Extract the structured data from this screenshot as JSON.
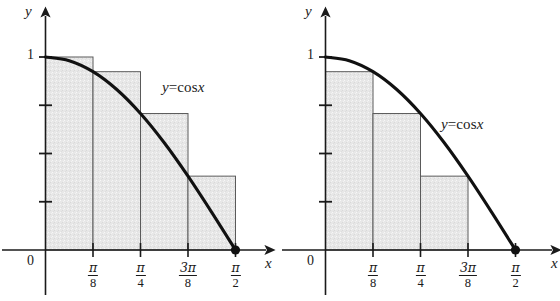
{
  "figure": {
    "background_color": "#ffffff",
    "ink_color": "#1a1a1a",
    "rect_fill_color": "#e5e5e5",
    "rect_border_color": "#555555",
    "curve_color": "#111111"
  },
  "panels": [
    {
      "id": "left",
      "axis_y_label": "y",
      "axis_x_label": "x",
      "origin_label": "0",
      "y_tick_label": "1",
      "curve_label": {
        "lhs": "y",
        "op": "=",
        "fn": "cos",
        "arg": "x",
        "full": "y = cos x"
      },
      "x_tick_labels": [
        {
          "num": "π",
          "den": "8"
        },
        {
          "num": "π",
          "den": "4"
        },
        {
          "num": "3π",
          "den": "8"
        },
        {
          "num": "π",
          "den": "2"
        }
      ]
    },
    {
      "id": "right",
      "axis_y_label": "y",
      "axis_x_label": "x",
      "origin_label": "0",
      "y_tick_label": "1",
      "curve_label": {
        "lhs": "y",
        "op": "=",
        "fn": "cos",
        "arg": "x",
        "full": "y = cos x"
      },
      "x_tick_labels": [
        {
          "num": "π",
          "den": "8"
        },
        {
          "num": "π",
          "den": "4"
        },
        {
          "num": "3π",
          "den": "8"
        },
        {
          "num": "π",
          "den": "2"
        }
      ]
    }
  ],
  "chart_data": [
    {
      "type": "bar",
      "id": "left-riemann-upper-sum",
      "title": "",
      "xlabel": "x",
      "ylabel": "y",
      "xlim": [
        0,
        1.5707963
      ],
      "ylim": [
        0,
        1.08
      ],
      "grid": false,
      "legend": null,
      "annotations": [
        "y = cos x"
      ],
      "x_tick_values": [
        0.3926991,
        0.7853982,
        1.1780972,
        1.5707963
      ],
      "x_tick_labels": [
        "π/8",
        "π/4",
        "3π/8",
        "π/2"
      ],
      "y_tick_values": [
        0.25,
        0.5,
        0.75,
        1.0
      ],
      "y_tick_labels": [
        "",
        "",
        "",
        "1"
      ],
      "bar_edges": [
        0.0,
        0.3926991,
        0.7853982,
        1.1780972,
        1.5707963
      ],
      "categories": [
        "[0, π/8]",
        "[π/8, π/4]",
        "[π/4, 3π/8]",
        "[3π/8, π/2]"
      ],
      "values": [
        1.0,
        0.9238795,
        0.7071068,
        0.3826834
      ],
      "series": [
        {
          "name": "y = cos x",
          "type": "line",
          "x": [
            0.0,
            0.1963495,
            0.3926991,
            0.5890486,
            0.7853982,
            0.9817477,
            1.1780972,
            1.3744468,
            1.5707963
          ],
          "values": [
            1.0,
            0.9807853,
            0.9238795,
            0.8314696,
            0.7071068,
            0.5555702,
            0.3826834,
            0.1950903,
            0.0
          ]
        }
      ],
      "markers": [
        {
          "x": 1.5707963,
          "y": 0.0,
          "style": "filled-circle"
        }
      ]
    },
    {
      "type": "bar",
      "id": "right-riemann-lower-sum",
      "title": "",
      "xlabel": "x",
      "ylabel": "y",
      "xlim": [
        0,
        1.5707963
      ],
      "ylim": [
        0,
        1.08
      ],
      "grid": false,
      "legend": null,
      "annotations": [
        "y = cos x"
      ],
      "x_tick_values": [
        0.3926991,
        0.7853982,
        1.1780972,
        1.5707963
      ],
      "x_tick_labels": [
        "π/8",
        "π/4",
        "3π/8",
        "π/2"
      ],
      "y_tick_values": [
        0.25,
        0.5,
        0.75,
        1.0
      ],
      "y_tick_labels": [
        "",
        "",
        "",
        "1"
      ],
      "bar_edges": [
        0.0,
        0.3926991,
        0.7853982,
        1.1780972,
        1.5707963
      ],
      "categories": [
        "[0, π/8]",
        "[π/8, π/4]",
        "[π/4, 3π/8]",
        "[3π/8, π/2]"
      ],
      "values": [
        0.9238795,
        0.7071068,
        0.3826834,
        0.0
      ],
      "series": [
        {
          "name": "y = cos x",
          "type": "line",
          "x": [
            0.0,
            0.1963495,
            0.3926991,
            0.5890486,
            0.7853982,
            0.9817477,
            1.1780972,
            1.3744468,
            1.5707963
          ],
          "values": [
            1.0,
            0.9807853,
            0.9238795,
            0.8314696,
            0.7071068,
            0.5555702,
            0.3826834,
            0.1950903,
            0.0
          ]
        }
      ],
      "markers": [
        {
          "x": 1.5707963,
          "y": 0.0,
          "style": "filled-circle"
        }
      ]
    }
  ]
}
